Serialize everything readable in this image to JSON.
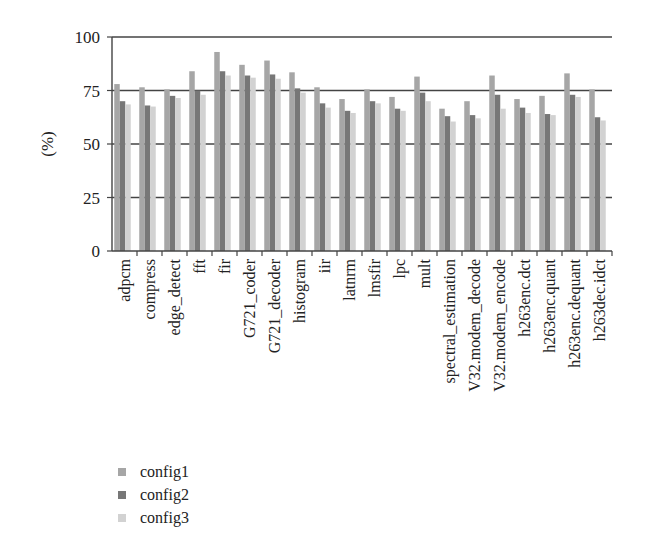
{
  "chart_data": {
    "type": "bar",
    "title": "",
    "xlabel": "",
    "ylabel": "(%)",
    "ylim": [
      0,
      100
    ],
    "yticks": [
      0,
      25,
      50,
      75,
      100
    ],
    "grid": {
      "horizontal": true,
      "vertical": false
    },
    "legend_position": "bottom-left",
    "categories": [
      "adpcm",
      "compress",
      "edge_detect",
      "fft",
      "fir",
      "G721_coder",
      "G721_decoder",
      "histogram",
      "iir",
      "latnrm",
      "lmsfir",
      "lpc",
      "mult",
      "spectral_estimation",
      "V32.modem_decode",
      "V32.modem_encode",
      "h263enc.dct",
      "h263enc.quant",
      "h263enc.dequant",
      "h263dec.idct"
    ],
    "series": [
      {
        "name": "config1",
        "color": "#a6a6a6",
        "values": [
          78,
          76.5,
          75.5,
          84,
          93,
          87,
          89,
          83.5,
          76.5,
          71,
          75.5,
          72,
          81.5,
          66.5,
          70,
          82,
          71,
          72.5,
          83,
          75.5
        ]
      },
      {
        "name": "config2",
        "color": "#777777",
        "values": [
          70,
          68,
          72.5,
          75,
          84,
          82,
          82.5,
          76,
          69,
          65.5,
          70,
          66.5,
          74,
          63,
          63.5,
          73,
          67,
          64,
          73,
          62.5
        ]
      },
      {
        "name": "config3",
        "color": "#d2d2d2",
        "values": [
          68.5,
          67.5,
          71.5,
          73,
          82,
          81,
          80.5,
          74,
          67,
          64.5,
          69,
          65.5,
          70,
          60.5,
          62,
          66.5,
          64.5,
          63.5,
          72,
          61
        ]
      }
    ]
  },
  "legend": {
    "items": [
      {
        "label": "config1",
        "color": "#a6a6a6"
      },
      {
        "label": "config2",
        "color": "#777777"
      },
      {
        "label": "config3",
        "color": "#d2d2d2"
      }
    ]
  }
}
